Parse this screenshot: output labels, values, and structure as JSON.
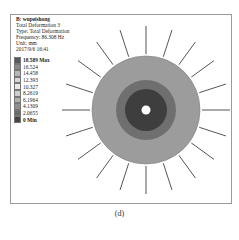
{
  "info": {
    "title": "B: wupeishong",
    "lines": [
      "Total Deformation 3",
      "Type: Total Deformation",
      "Frequency: 86.308 Hz",
      "Unit: mm",
      "2017/9/6 16:41"
    ]
  },
  "legend": [
    {
      "label": "18.589 Max",
      "color": "#5a5a5a"
    },
    {
      "label": "16.524",
      "color": "#8a8a8a"
    },
    {
      "label": "14.458",
      "color": "#b8b8b8"
    },
    {
      "label": "12.393",
      "color": "#d8d8d8"
    },
    {
      "label": "10.327",
      "color": "#e8e8e8"
    },
    {
      "label": "8.2619",
      "color": "#cfcfcf"
    },
    {
      "label": "6.1964",
      "color": "#b0b0b0"
    },
    {
      "label": "4.1309",
      "color": "#8e8e8e"
    },
    {
      "label": "2.0655",
      "color": "#6a6a6a"
    },
    {
      "label": "0 Min",
      "color": "#444444"
    }
  ],
  "plot": {
    "center": [
      96,
      90
    ],
    "rings": [
      {
        "r": 54,
        "color": "#9c9c9c"
      },
      {
        "r": 30,
        "color": "#6f6f6f"
      },
      {
        "r": 21,
        "color": "#3e3e3e"
      },
      {
        "r": 4.5,
        "color": "#ffffff"
      }
    ],
    "spokes": 20,
    "spoke_inner": 56,
    "spoke_outer": 84,
    "spoke_color": "#555555"
  },
  "caption": "(d)"
}
